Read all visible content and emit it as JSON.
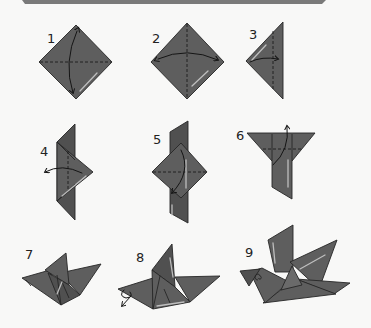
{
  "diagram": {
    "type": "origami-instructions",
    "banner_color": "#7a7a7a",
    "paper_color": "#5e5e5e",
    "background_color": "#f8f8f7",
    "steps": [
      {
        "number": "1",
        "action": "fold diagonally in half (valley fold) and unfold",
        "shape": "square on point",
        "arrow": "curved, double-headed, vertical"
      },
      {
        "number": "2",
        "action": "fold along other diagonal and unfold",
        "shape": "square on point",
        "arrow": "curved, double-headed, horizontal"
      },
      {
        "number": "3",
        "action": "fold left corner to the right",
        "shape": "triangle",
        "arrow": "curved, rightward"
      },
      {
        "number": "4",
        "action": "fold flap back to the left",
        "shape": "layered triangle",
        "arrow": "curved, leftward"
      },
      {
        "number": "5",
        "action": "fold top point down",
        "shape": "diamond over strip",
        "arrow": "curved, downward"
      },
      {
        "number": "6",
        "action": "fold flap up",
        "shape": "funnel shape",
        "arrow": "curved, upward"
      },
      {
        "number": "7",
        "action": "shape the bird body",
        "shape": "bird base",
        "arrow": ""
      },
      {
        "number": "8",
        "action": "inside-reverse fold to form head",
        "shape": "bird with wing",
        "arrow": "reverse-fold arrow at left tip"
      },
      {
        "number": "9",
        "action": "finished bird",
        "shape": "completed bird with eye",
        "arrow": ""
      }
    ]
  }
}
